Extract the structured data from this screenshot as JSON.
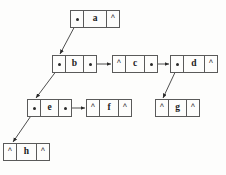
{
  "diagram": {
    "type": "node-pointer-diagram",
    "colors": {
      "background": "#fdfdfc",
      "border": "#5a5a5a",
      "text": "#1b1b1b",
      "edge": "#3a3a3a"
    },
    "nil_symbol": "^",
    "nodes": [
      {
        "id": "a",
        "label": "a",
        "left_cell": "",
        "right_cell": "^",
        "x": 70,
        "y": 10,
        "w": 50
      },
      {
        "id": "b",
        "label": "b",
        "left_cell": "",
        "right_cell": "",
        "x": 52,
        "y": 55,
        "w": 45
      },
      {
        "id": "c",
        "label": "c",
        "left_cell": "^",
        "right_cell": "",
        "x": 112,
        "y": 55,
        "w": 46
      },
      {
        "id": "d",
        "label": "d",
        "left_cell": "",
        "right_cell": "^",
        "x": 170,
        "y": 55,
        "w": 48
      },
      {
        "id": "e",
        "label": "e",
        "left_cell": "",
        "right_cell": "",
        "x": 27,
        "y": 99,
        "w": 45
      },
      {
        "id": "f",
        "label": "f",
        "left_cell": "^",
        "right_cell": "^",
        "x": 86,
        "y": 99,
        "w": 46
      },
      {
        "id": "g",
        "label": "g",
        "left_cell": "^",
        "right_cell": "^",
        "x": 155,
        "y": 99,
        "w": 45
      },
      {
        "id": "h",
        "label": "h",
        "left_cell": "^",
        "right_cell": "^",
        "x": 3,
        "y": 143,
        "w": 47
      }
    ],
    "edges": [
      {
        "id": "a-to-b",
        "from": "a",
        "to": "b",
        "kind": "child",
        "x1": 77,
        "y1": 22,
        "x2": 60,
        "y2": 54
      },
      {
        "id": "b-to-c",
        "from": "b",
        "to": "c",
        "kind": "sibling",
        "x1": 92,
        "y1": 64,
        "x2": 111,
        "y2": 64
      },
      {
        "id": "c-to-d",
        "from": "c",
        "to": "d",
        "kind": "sibling",
        "x1": 152,
        "y1": 64,
        "x2": 169,
        "y2": 64
      },
      {
        "id": "b-to-e",
        "from": "b",
        "to": "e",
        "kind": "child",
        "x1": 60,
        "y1": 66,
        "x2": 36,
        "y2": 98
      },
      {
        "id": "e-to-f",
        "from": "e",
        "to": "f",
        "kind": "sibling",
        "x1": 67,
        "y1": 108,
        "x2": 85,
        "y2": 108
      },
      {
        "id": "d-to-g",
        "from": "d",
        "to": "g",
        "kind": "child",
        "x1": 178,
        "y1": 66,
        "x2": 163,
        "y2": 98
      },
      {
        "id": "e-to-h",
        "from": "e",
        "to": "h",
        "kind": "child",
        "x1": 35,
        "y1": 110,
        "x2": 13,
        "y2": 142
      }
    ]
  }
}
